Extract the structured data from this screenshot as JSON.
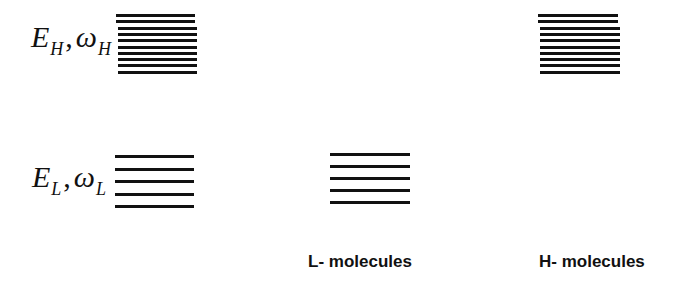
{
  "diagram": {
    "labels": {
      "high": {
        "symbol_energy": "E",
        "sub_energy": "H",
        "separator": ",",
        "symbol_freq": "ω",
        "sub_freq": "H"
      },
      "low": {
        "symbol_energy": "E",
        "sub_energy": "L",
        "separator": ",",
        "symbol_freq": "ω",
        "sub_freq": "L"
      }
    },
    "groups": [
      {
        "name": "L- molecules",
        "levels": 5
      },
      {
        "name": "H- molecules",
        "levels": 10
      }
    ],
    "reference_stacks": {
      "high_levels": 10,
      "low_levels": 5
    },
    "line_color": "#111111"
  }
}
